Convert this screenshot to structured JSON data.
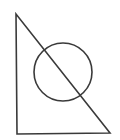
{
  "diagram": {
    "background": "#ffffff",
    "stroke_color": "#3a3a3a",
    "stroke_width": 1.6,
    "triangle": {
      "points": [
        [
          16,
          14
        ],
        [
          17,
          134
        ],
        [
          110,
          133
        ]
      ]
    },
    "circle": {
      "cx": 63,
      "cy": 72,
      "r": 29
    }
  }
}
